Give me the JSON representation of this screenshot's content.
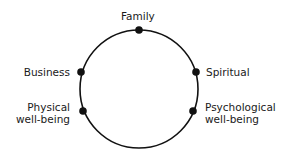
{
  "diagram": {
    "type": "circle-with-nodes",
    "nodes": [
      {
        "label": "Family"
      },
      {
        "label": "Business"
      },
      {
        "label": "Spiritual"
      },
      {
        "label_line1": "Physical",
        "label_line2": "well-being"
      },
      {
        "label_line1": "Psychological",
        "label_line2": "well-being"
      }
    ],
    "colors": {
      "stroke": "#111111",
      "node": "#111111",
      "text": "#1a1a1a",
      "background": "#ffffff"
    }
  }
}
